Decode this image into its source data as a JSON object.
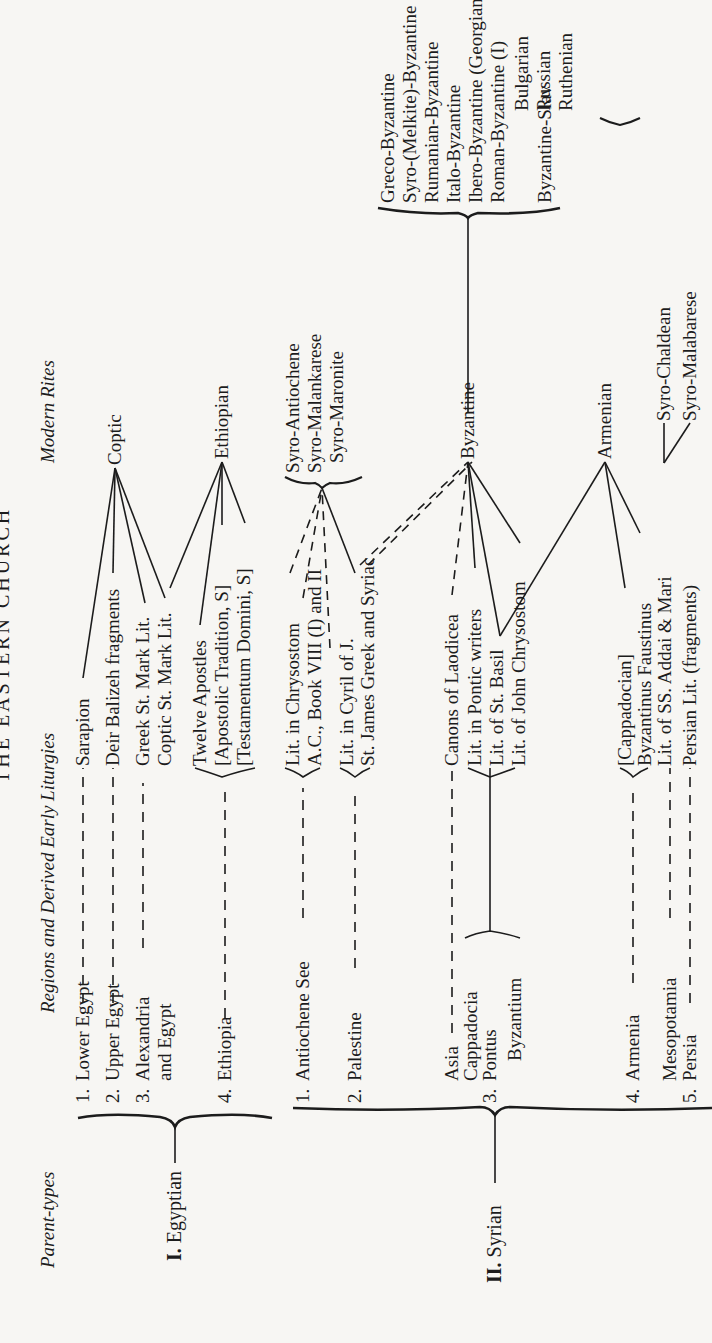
{
  "page": {
    "title": "THE EASTERN CHURCH",
    "orientation": "rotated 90° counter-clockwise"
  },
  "headers": {
    "parent_types": "Parent-types",
    "regions": "Regions and Derived Early Liturgies",
    "modern_rites": "Modern Rites"
  },
  "parents": [
    {
      "numeral": "I.",
      "name": "Egyptian"
    },
    {
      "numeral": "II.",
      "name": "Syrian"
    }
  ],
  "egyptian": {
    "regions": [
      {
        "num": "1.",
        "name": "Lower Egypt"
      },
      {
        "num": "2.",
        "name": "Upper Egypt"
      },
      {
        "num": "3.",
        "name": "Alexandria",
        "name2": "and Egypt"
      },
      {
        "num": "4.",
        "name": "Ethiopia"
      }
    ],
    "liturgies": [
      "Sarapion",
      "Deir Balizeh fragments",
      "Greek St. Mark Lit.",
      "Coptic St. Mark Lit.",
      "Twelve Apostles",
      "[Apostolic Tradition, S]",
      "[Testamentum Domini, S]"
    ],
    "rites": [
      "Coptic",
      "Ethiopian"
    ]
  },
  "syrian": {
    "regions": [
      {
        "num": "1.",
        "name": "Antiochene See"
      },
      {
        "num": "2.",
        "name": "Palestine"
      },
      {
        "num": "",
        "name": "Asia"
      },
      {
        "num": "",
        "name": "Cappadocia"
      },
      {
        "num": "3.",
        "name": "Pontus"
      },
      {
        "num": "",
        "name": "Byzantium"
      },
      {
        "num": "4.",
        "name": "Armenia"
      },
      {
        "num": "",
        "name": "Mesopotamia"
      },
      {
        "num": "5.",
        "name": "Persia"
      }
    ],
    "liturgies": [
      "Lit. in Chrysostom",
      "A.C., Book VIII (I) and II",
      "Lit. in Cyril of J.",
      "St. James Greek and Syriac",
      "Canons of Laodicea",
      "Lit. in Pontic writers",
      "Lit. of St. Basil",
      "Lit. of John Chrysostom",
      "[Cappadocian]",
      "Byzantinus Faustinus",
      "Lit. of SS. Addai & Mari",
      "Persian Lit. (fragments)"
    ],
    "rites": {
      "antiochene_group": [
        "Syro-Antiochene",
        "Syro-Malankarese",
        "Syro-Maronite"
      ],
      "byzantine": "Byzantine",
      "byzantine_branches": [
        "Greco-Byzantine",
        "Syro-(Melkite)-Byzantine",
        "Rumanian-Byzantine",
        "Italo-Byzantine",
        "Ibero-Byzantine (Georgian)",
        "Roman-Byzantine (I)"
      ],
      "byzantine_slav": "Byzantine-Slav",
      "slav_branches": [
        "Bulgarian",
        "Russian",
        "Ruthenian"
      ],
      "armenian": "Armenian",
      "syro_chaldean": "Syro-Chaldean",
      "syro_malabarese": "Syro-Malabarese"
    }
  }
}
